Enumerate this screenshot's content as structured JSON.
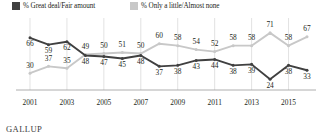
{
  "legend": {
    "items": [
      {
        "label": "% Great deal/Fair amount",
        "color": "#404040",
        "icon": "square-swatch-dark"
      },
      {
        "label": "% Only a little/Almost none",
        "color": "#c8c8c8",
        "icon": "square-swatch-light"
      }
    ]
  },
  "footer": {
    "brand": "GALLUP"
  },
  "axis": {
    "tick_labels": [
      "2001",
      "2003",
      "2005",
      "2007",
      "2009",
      "2011",
      "2013",
      "2015"
    ]
  },
  "chart_data": {
    "type": "line",
    "title": "",
    "subtitle": "",
    "xlabel": "",
    "ylabel": "",
    "grid": true,
    "grid_axis": "x",
    "legend_position": "top-left",
    "ylim": [
      15,
      80
    ],
    "x": [
      2001,
      2002,
      2003,
      2004,
      2005,
      2006,
      2007,
      2008,
      2009,
      2010,
      2011,
      2012,
      2013,
      2014,
      2015,
      2016
    ],
    "xtick_labels": [
      "2001",
      "2003",
      "2005",
      "2007",
      "2009",
      "2011",
      "2013",
      "2015"
    ],
    "xticks": [
      2001,
      2003,
      2005,
      2007,
      2009,
      2011,
      2013,
      2015
    ],
    "series": [
      {
        "name": "% Great deal/Fair amount",
        "color": "#404040",
        "values": [
          66,
          59,
          62,
          48,
          47,
          45,
          48,
          37,
          38,
          43,
          44,
          38,
          39,
          24,
          38,
          33
        ],
        "label_position": "below"
      },
      {
        "name": "% Only a little/Almost none",
        "color": "#c8c8c8",
        "values": [
          30,
          37,
          35,
          49,
          50,
          51,
          50,
          60,
          58,
          54,
          52,
          58,
          58,
          71,
          58,
          67
        ],
        "label_position": "above"
      }
    ]
  }
}
